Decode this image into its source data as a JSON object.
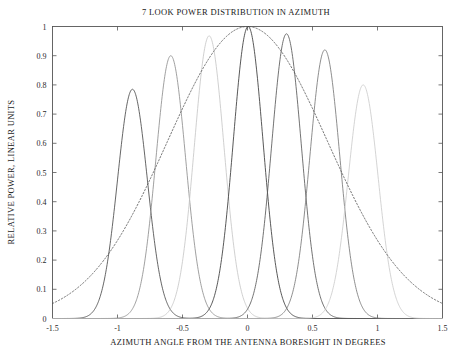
{
  "chart_data": {
    "type": "line",
    "title": "7 LOOK POWER DISTRIBUTION IN AZIMUTH",
    "xlabel": "AZIMUTH ANGLE FROM THE ANTENNA BORESIGHT IN DEGREES",
    "ylabel": "RELATIVE POWER, LINEAR UNITS",
    "xlim": [
      -1.5,
      1.5
    ],
    "ylim": [
      0,
      1
    ],
    "xticks": [
      -1.5,
      -1,
      -0.5,
      0,
      0.5,
      1,
      1.5
    ],
    "xticklabels": [
      "-1.5",
      "-1",
      "-0.5",
      "0",
      "0.5",
      "1",
      "1.5"
    ],
    "yticks": [
      0,
      0.1,
      0.2,
      0.3,
      0.4,
      0.5,
      0.6,
      0.7,
      0.8,
      0.9,
      1
    ],
    "yticklabels": [
      "0",
      "0.1",
      "0.2",
      "0.3",
      "0.4",
      "0.5",
      "0.6",
      "0.7",
      "0.8",
      "0.9",
      "1"
    ],
    "grid": false,
    "legend": "none",
    "series": [
      {
        "name": "look-1",
        "style": "solid",
        "color": "#4a4a4a",
        "peak_x": -0.885,
        "peak_y": 0.785,
        "beamwidth": 0.27
      },
      {
        "name": "look-2",
        "style": "solid",
        "color": "#8f8f8f",
        "peak_x": -0.59,
        "peak_y": 0.9,
        "beamwidth": 0.27
      },
      {
        "name": "look-3",
        "style": "solid",
        "color": "#c8c8c8",
        "peak_x": -0.295,
        "peak_y": 0.968,
        "beamwidth": 0.27
      },
      {
        "name": "look-4",
        "style": "solid",
        "color": "#3a3a3a",
        "peak_x": 0.005,
        "peak_y": 1.0,
        "beamwidth": 0.27
      },
      {
        "name": "look-5",
        "style": "solid",
        "color": "#5a5a5a",
        "peak_x": 0.3,
        "peak_y": 0.975,
        "beamwidth": 0.27
      },
      {
        "name": "look-6",
        "style": "solid",
        "color": "#7a7a7a",
        "peak_x": 0.595,
        "peak_y": 0.92,
        "beamwidth": 0.27
      },
      {
        "name": "look-7",
        "style": "solid",
        "color": "#cccccc",
        "peak_x": 0.89,
        "peak_y": 0.8,
        "beamwidth": 0.27
      },
      {
        "name": "envelope",
        "style": "dotted",
        "color": "#555555",
        "peak_x": 0.0,
        "peak_y": 1.0,
        "beamwidth": 1.45,
        "endpoints": [
          {
            "x": -1.5,
            "y": 0.5
          },
          {
            "x": 1.5,
            "y": 0.51
          }
        ]
      }
    ]
  }
}
